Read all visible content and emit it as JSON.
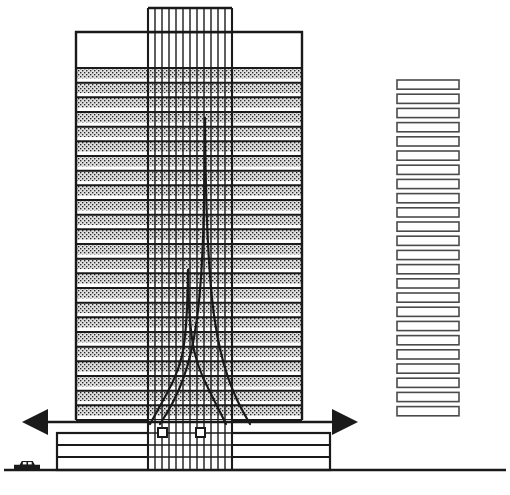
{
  "diagram": {
    "type": "architectural-section-line-drawing",
    "canvas": {
      "width": 510,
      "height": 495
    },
    "colors": {
      "ink": "#1a1a1a",
      "paper": "#ffffff",
      "floor_fill": "#d9d9d9",
      "stipple_dot": "#2b2b2b",
      "bar_fill": "#fefefe",
      "bar_stroke": "#4a4a4a"
    },
    "ground_line": {
      "y": 470,
      "x_start": 4,
      "x_end": 506,
      "stroke_width": 2.6
    }
  },
  "tower": {
    "label": "main tower mass",
    "x": 76,
    "right": 302,
    "top": 32,
    "bottom": 420,
    "stroke_width": 2.4,
    "parapet": {
      "top": 32,
      "bottom": 68,
      "label": "blank parapet band"
    },
    "floor_count": 24,
    "floor_band_top": 68,
    "floor_band_bottom": 420,
    "floor_pitch": 14.67,
    "floor_fill_height": 10.4,
    "floors": [
      {
        "index": 1,
        "y": 68.0
      },
      {
        "index": 2,
        "y": 82.7
      },
      {
        "index": 3,
        "y": 97.3
      },
      {
        "index": 4,
        "y": 112.0
      },
      {
        "index": 5,
        "y": 126.7
      },
      {
        "index": 6,
        "y": 141.3
      },
      {
        "index": 7,
        "y": 156.0
      },
      {
        "index": 8,
        "y": 170.7
      },
      {
        "index": 9,
        "y": 185.3
      },
      {
        "index": 10,
        "y": 200.0
      },
      {
        "index": 11,
        "y": 214.7
      },
      {
        "index": 12,
        "y": 229.3
      },
      {
        "index": 13,
        "y": 244.0
      },
      {
        "index": 14,
        "y": 258.7
      },
      {
        "index": 15,
        "y": 273.3
      },
      {
        "index": 16,
        "y": 288.0
      },
      {
        "index": 17,
        "y": 302.7
      },
      {
        "index": 18,
        "y": 317.3
      },
      {
        "index": 19,
        "y": 332.0
      },
      {
        "index": 20,
        "y": 346.7
      },
      {
        "index": 21,
        "y": 361.3
      },
      {
        "index": 22,
        "y": 376.0
      },
      {
        "index": 23,
        "y": 390.7
      },
      {
        "index": 24,
        "y": 405.3
      }
    ]
  },
  "core": {
    "label": "glazed service core / mullion grid",
    "x": 148,
    "right": 232,
    "top": 8,
    "bottom": 470,
    "stroke_width": 1.5,
    "cap_stroke_width": 2.4,
    "mullion_count": 13,
    "mullion_x": [
      148,
      155,
      162,
      169,
      176,
      183,
      190,
      197,
      204,
      211,
      218,
      225,
      232
    ],
    "boxes": [
      {
        "x": 158,
        "y": 428,
        "w": 9,
        "h": 9,
        "label": "core opening left"
      },
      {
        "x": 196,
        "y": 428,
        "w": 9,
        "h": 9,
        "label": "core opening right"
      }
    ]
  },
  "curves": {
    "label": "flared structural / stress profile curves",
    "stroke_width": 2.2,
    "items": [
      {
        "name": "tall-peak-curve",
        "apex_x": 205,
        "apex_y": 118,
        "foot_y": 424,
        "left_foot_x": 160,
        "right_foot_x": 250
      },
      {
        "name": "short-peak-curve",
        "apex_x": 188,
        "apex_y": 270,
        "foot_y": 424,
        "left_foot_x": 150,
        "right_foot_x": 226
      }
    ]
  },
  "arrow": {
    "label": "overall width dimension arrow",
    "y": 422,
    "x_left": 22,
    "x_right": 358,
    "stroke_width": 2.4,
    "head_length": 26,
    "head_half_height": 13,
    "direction": "double-headed"
  },
  "podium": {
    "label": "low-rise podium base",
    "x": 57,
    "right": 330,
    "top": 433,
    "bottom": 470,
    "stroke_width": 2.2,
    "floor_lines_y": [
      445,
      457
    ],
    "floor_count": 3
  },
  "scale_car": {
    "label": "automobile shown for scale",
    "x": 14,
    "y": 461,
    "width": 26,
    "height": 9
  },
  "bar_column": {
    "label": "stacked floor-plate bars (typical floor schedule)",
    "x": 397,
    "width": 62,
    "top": 80,
    "bar_count": 24,
    "bar_height": 9.2,
    "bar_pitch": 14.2,
    "stroke_width": 1.6,
    "bars": [
      {
        "index": 1,
        "y": 80.0
      },
      {
        "index": 2,
        "y": 94.2
      },
      {
        "index": 3,
        "y": 108.4
      },
      {
        "index": 4,
        "y": 122.6
      },
      {
        "index": 5,
        "y": 136.8
      },
      {
        "index": 6,
        "y": 151.0
      },
      {
        "index": 7,
        "y": 165.2
      },
      {
        "index": 8,
        "y": 179.4
      },
      {
        "index": 9,
        "y": 193.6
      },
      {
        "index": 10,
        "y": 207.8
      },
      {
        "index": 11,
        "y": 222.0
      },
      {
        "index": 12,
        "y": 236.2
      },
      {
        "index": 13,
        "y": 250.4
      },
      {
        "index": 14,
        "y": 264.6
      },
      {
        "index": 15,
        "y": 278.8
      },
      {
        "index": 16,
        "y": 293.0
      },
      {
        "index": 17,
        "y": 307.2
      },
      {
        "index": 18,
        "y": 321.4
      },
      {
        "index": 19,
        "y": 335.6
      },
      {
        "index": 20,
        "y": 349.8
      },
      {
        "index": 21,
        "y": 364.0
      },
      {
        "index": 22,
        "y": 378.2
      },
      {
        "index": 23,
        "y": 392.4
      },
      {
        "index": 24,
        "y": 406.6
      }
    ]
  }
}
